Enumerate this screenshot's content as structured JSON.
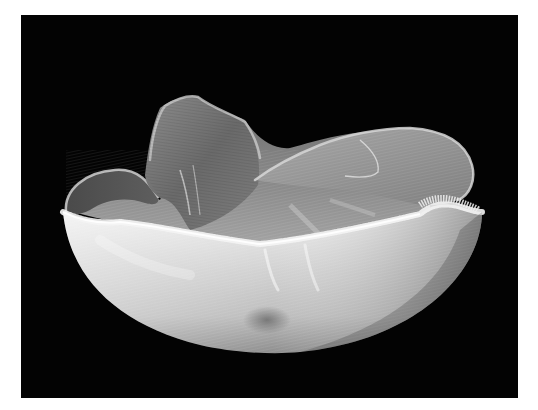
{
  "image": {
    "subject": "sculptural fibrous bowl with ruffled wavy rim",
    "background_color": "#030303",
    "border_color": "#ffffff",
    "object_tone_light": "#e6e6e6",
    "object_tone_mid": "#9a9a9a",
    "object_tone_dark": "#4a4a4a"
  }
}
